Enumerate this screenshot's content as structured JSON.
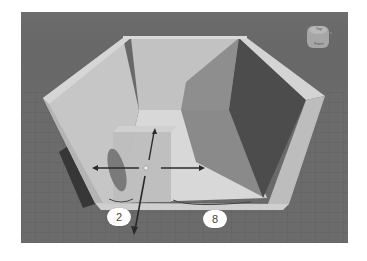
{
  "viewport": {
    "background": "#6b6b6b",
    "floor_grid_color": "#5e5e5e"
  },
  "view_cube": {
    "icon": "view-cube-icon",
    "faces": [
      "Top",
      "Front"
    ]
  },
  "model": {
    "type": "open box walls",
    "wall_color": "#c9c9c9",
    "shadow_color": "#4a4a4a"
  },
  "gizmo": {
    "icon": "move-gizmo-icon",
    "axes": [
      "x-left",
      "x-right",
      "y-up",
      "z-down"
    ]
  },
  "dimension_badges": [
    {
      "value": "2"
    },
    {
      "value": "8"
    }
  ]
}
